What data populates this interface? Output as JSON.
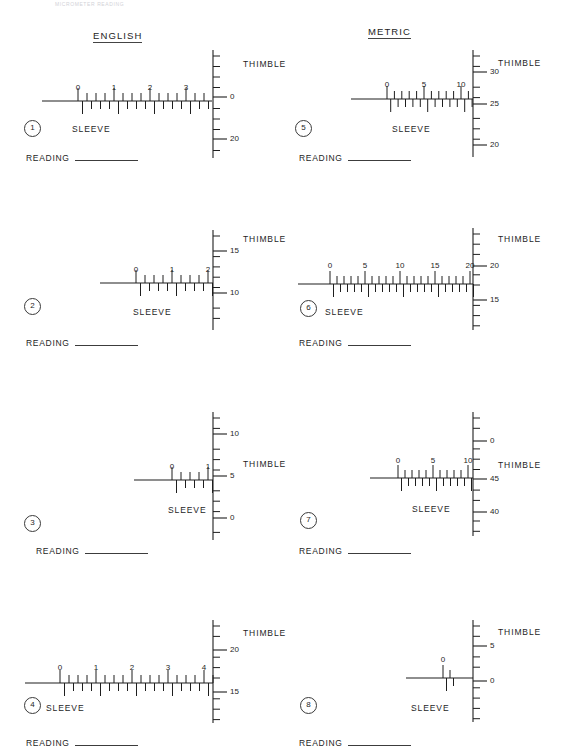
{
  "page": {
    "faint_header": "MICROMETER READING",
    "reading_label": "READING",
    "sleeve_label": "SLEEVE",
    "thimble_label": "THIMBLE",
    "ink_color": "#1e1e1e",
    "rule_color": "#3c3c3c"
  },
  "sections": [
    {
      "name": "english",
      "title": "ENGLISH",
      "x": 93,
      "y": 30
    },
    {
      "name": "metric",
      "title": "METRIC",
      "x": 368,
      "y": 26
    }
  ],
  "exercises": [
    {
      "id": "1",
      "number": "1",
      "system": "english",
      "panel": {
        "x": 0,
        "y": 18
      },
      "sleeve": {
        "axis_y": 101,
        "line_x1": 42,
        "line_x2": 212,
        "tick_start_x": 78,
        "tick_spacing": 9.0,
        "tick_count": 30,
        "labels": [
          "0",
          "1",
          "2",
          "3",
          "4",
          "5",
          "6",
          "7"
        ],
        "label_every": 4,
        "label_y": 83,
        "label_text": "SLEEVE",
        "label_pos": {
          "x": 72,
          "y": 124
        }
      },
      "thimble": {
        "axis_x": 213,
        "axis_y1": 50,
        "axis_y2": 158,
        "tick_spacing": 10.5,
        "tick_count": 11,
        "ticks": [
          {
            "value": "0",
            "y": 97,
            "major": true
          },
          {
            "value": "20",
            "y": 139,
            "major": true
          }
        ],
        "label_text": "THIMBLE",
        "label_pos": {
          "x": 243,
          "y": 59
        }
      },
      "circle_pos": {
        "x": 24,
        "y": 120
      },
      "reading_pos": {
        "x": 26,
        "y": 153
      }
    },
    {
      "id": "5",
      "number": "5",
      "system": "metric",
      "panel": {
        "x": 283,
        "y": 18
      },
      "sleeve": {
        "axis_y": 99,
        "line_x1": 351,
        "line_x2": 473,
        "tick_start_x": 387,
        "tick_spacing": 7.4,
        "tick_count": 12,
        "labels": [
          "0",
          "5",
          "10"
        ],
        "label_every": 5,
        "label_y": 80,
        "label_text": "SLEEVE",
        "label_pos": {
          "x": 392,
          "y": 124
        }
      },
      "thimble": {
        "axis_x": 473,
        "axis_y1": 50,
        "axis_y2": 157,
        "tick_spacing": 10.4,
        "tick_count": 11,
        "ticks": [
          {
            "value": "30",
            "y": 72,
            "major": true
          },
          {
            "value": "25",
            "y": 104,
            "major": true
          },
          {
            "value": "20",
            "y": 145,
            "major": true
          }
        ],
        "label_text": "THIMBLE",
        "label_pos": {
          "x": 498,
          "y": 58
        }
      },
      "circle_pos": {
        "x": 295,
        "y": 120
      },
      "reading_pos": {
        "x": 299,
        "y": 153
      }
    },
    {
      "id": "2",
      "number": "2",
      "system": "english",
      "panel": {
        "x": 0,
        "y": 208
      },
      "sleeve": {
        "axis_y": 283,
        "line_x1": 100,
        "line_x2": 213,
        "tick_start_x": 136,
        "tick_spacing": 9.0,
        "tick_count": 18,
        "labels": [
          "0",
          "1",
          "2",
          "3",
          "4"
        ],
        "label_every": 4,
        "label_y": 265,
        "label_text": "SLEEVE",
        "label_pos": {
          "x": 133,
          "y": 307
        }
      },
      "thimble": {
        "axis_x": 213,
        "axis_y1": 230,
        "axis_y2": 330,
        "tick_spacing": 10.3,
        "tick_count": 10,
        "ticks": [
          {
            "value": "15",
            "y": 251,
            "major": true
          },
          {
            "value": "10",
            "y": 293,
            "major": true
          }
        ],
        "label_text": "THIMBLE",
        "label_pos": {
          "x": 243,
          "y": 234
        }
      },
      "circle_pos": {
        "x": 24,
        "y": 298
      },
      "reading_pos": {
        "x": 26,
        "y": 338
      }
    },
    {
      "id": "6",
      "number": "6",
      "system": "metric",
      "panel": {
        "x": 283,
        "y": 208
      },
      "sleeve": {
        "axis_y": 284,
        "line_x1": 298,
        "line_x2": 473,
        "tick_start_x": 330,
        "tick_spacing": 7.0,
        "tick_count": 21,
        "labels": [
          "0",
          "5",
          "10",
          "15",
          "20"
        ],
        "label_every": 5,
        "label_y": 261,
        "label_text": "SLEEVE",
        "label_pos": {
          "x": 325,
          "y": 307
        }
      },
      "thimble": {
        "axis_x": 473,
        "axis_y1": 228,
        "axis_y2": 330,
        "tick_spacing": 10.2,
        "tick_count": 10,
        "ticks": [
          {
            "value": "20",
            "y": 266,
            "major": true
          },
          {
            "value": "15",
            "y": 300,
            "major": true
          }
        ],
        "label_text": "THIMBLE",
        "label_pos": {
          "x": 498,
          "y": 234
        }
      },
      "circle_pos": {
        "x": 300,
        "y": 300
      },
      "reading_pos": {
        "x": 299,
        "y": 338
      }
    },
    {
      "id": "3",
      "number": "3",
      "system": "english",
      "panel": {
        "x": 0,
        "y": 400
      },
      "sleeve": {
        "axis_y": 480,
        "line_x1": 134,
        "line_x2": 213,
        "tick_start_x": 172,
        "tick_spacing": 9.0,
        "tick_count": 10,
        "labels": [
          "0",
          "1",
          "2"
        ],
        "label_every": 4,
        "label_y": 462,
        "label_text": "SLEEVE",
        "label_pos": {
          "x": 168,
          "y": 505
        }
      },
      "thimble": {
        "axis_x": 213,
        "axis_y1": 412,
        "axis_y2": 540,
        "tick_spacing": 10.4,
        "tick_count": 13,
        "ticks": [
          {
            "value": "10",
            "y": 434,
            "major": true
          },
          {
            "value": "5",
            "y": 476,
            "major": true
          },
          {
            "value": "0",
            "y": 518,
            "major": true
          }
        ],
        "label_text": "THIMBLE",
        "label_pos": {
          "x": 243,
          "y": 459
        }
      },
      "circle_pos": {
        "x": 24,
        "y": 515
      },
      "reading_pos": {
        "x": 36,
        "y": 546
      }
    },
    {
      "id": "7",
      "number": "7",
      "system": "metric",
      "panel": {
        "x": 283,
        "y": 400
      },
      "sleeve": {
        "axis_y": 478,
        "line_x1": 370,
        "line_x2": 473,
        "tick_start_x": 398,
        "tick_spacing": 7.0,
        "tick_count": 11,
        "labels": [
          "0",
          "5",
          "10"
        ],
        "label_every": 5,
        "label_y": 456,
        "label_text": "SLEEVE",
        "label_pos": {
          "x": 412,
          "y": 504
        }
      },
      "thimble": {
        "axis_x": 473,
        "axis_y1": 412,
        "axis_y2": 536,
        "tick_spacing": 10.3,
        "tick_count": 12,
        "ticks": [
          {
            "value": "0",
            "y": 441,
            "major": true
          },
          {
            "value": "45",
            "y": 479,
            "major": true
          },
          {
            "value": "40",
            "y": 512,
            "major": true
          }
        ],
        "label_text": "THIMBLE",
        "label_pos": {
          "x": 498,
          "y": 460
        }
      },
      "circle_pos": {
        "x": 300,
        "y": 512
      },
      "reading_pos": {
        "x": 299,
        "y": 546
      }
    },
    {
      "id": "4",
      "number": "4",
      "system": "english",
      "panel": {
        "x": 0,
        "y": 600
      },
      "sleeve": {
        "axis_y": 683,
        "line_x1": 25,
        "line_x2": 213,
        "tick_start_x": 60,
        "tick_spacing": 9.0,
        "tick_count": 34,
        "labels": [
          "0",
          "1",
          "2",
          "3",
          "4",
          "5",
          "6",
          "7",
          "8"
        ],
        "label_every": 4,
        "label_y": 663,
        "label_text": "SLEEVE",
        "label_pos": {
          "x": 46,
          "y": 703
        }
      },
      "thimble": {
        "axis_x": 213,
        "axis_y1": 620,
        "axis_y2": 723,
        "tick_spacing": 10.4,
        "tick_count": 10,
        "ticks": [
          {
            "value": "20",
            "y": 650,
            "major": true
          },
          {
            "value": "15",
            "y": 692,
            "major": true
          }
        ],
        "label_text": "THIMBLE",
        "label_pos": {
          "x": 243,
          "y": 628
        }
      },
      "circle_pos": {
        "x": 24,
        "y": 697
      },
      "reading_pos": {
        "x": 26,
        "y": 738
      }
    },
    {
      "id": "8",
      "number": "8",
      "system": "metric",
      "panel": {
        "x": 283,
        "y": 600
      },
      "sleeve": {
        "axis_y": 678,
        "line_x1": 406,
        "line_x2": 473,
        "tick_start_x": 443,
        "tick_spacing": 7.0,
        "tick_count": 2,
        "labels": [
          "0"
        ],
        "label_every": 5,
        "label_y": 655,
        "label_text": "SLEEVE",
        "label_pos": {
          "x": 411,
          "y": 703
        }
      },
      "thimble": {
        "axis_x": 473,
        "axis_y1": 620,
        "axis_y2": 722,
        "tick_spacing": 10.3,
        "tick_count": 11,
        "ticks": [
          {
            "value": "5",
            "y": 646,
            "major": true
          },
          {
            "value": "0",
            "y": 681,
            "major": true
          }
        ],
        "label_text": "THIMBLE",
        "label_pos": {
          "x": 498,
          "y": 627
        }
      },
      "circle_pos": {
        "x": 300,
        "y": 697
      },
      "reading_pos": {
        "x": 299,
        "y": 738
      }
    }
  ]
}
